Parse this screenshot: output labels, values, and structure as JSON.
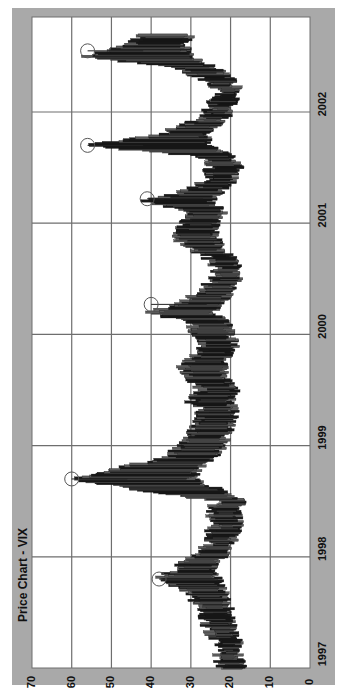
{
  "chart_data": {
    "type": "bar",
    "subtype": "high-low price bars (weekly), rotated 90 degrees",
    "title": "Price Chart - VIX",
    "xlabel": "",
    "ylabel": "",
    "value_axis": {
      "ticks": [
        70,
        60,
        50,
        40,
        30,
        20,
        10,
        0
      ],
      "range": [
        0,
        70
      ],
      "grid": true
    },
    "time_axis": {
      "ticks": [
        "1997",
        "1998",
        "1999",
        "2000",
        "2001",
        "2002"
      ],
      "grid": true
    },
    "orientation": "value axis horizontal (70 left to 0 right); time axis vertical (1997 bottom to 2002 top)",
    "series": [
      {
        "name": "VIX weekly range",
        "points": [
          {
            "t": 1997.0,
            "low": 17,
            "high": 22
          },
          {
            "t": 1997.1,
            "low": 18,
            "high": 23
          },
          {
            "t": 1997.2,
            "low": 18,
            "high": 22
          },
          {
            "t": 1997.3,
            "low": 19,
            "high": 25
          },
          {
            "t": 1997.4,
            "low": 20,
            "high": 27
          },
          {
            "t": 1997.5,
            "low": 20,
            "high": 26
          },
          {
            "t": 1997.6,
            "low": 21,
            "high": 29
          },
          {
            "t": 1997.7,
            "low": 22,
            "high": 31
          },
          {
            "t": 1997.8,
            "low": 23,
            "high": 38
          },
          {
            "t": 1997.9,
            "low": 25,
            "high": 33
          },
          {
            "t": 1998.0,
            "low": 22,
            "high": 30
          },
          {
            "t": 1998.1,
            "low": 20,
            "high": 26
          },
          {
            "t": 1998.2,
            "low": 19,
            "high": 25
          },
          {
            "t": 1998.3,
            "low": 18,
            "high": 24
          },
          {
            "t": 1998.4,
            "low": 18,
            "high": 25
          },
          {
            "t": 1998.5,
            "low": 17,
            "high": 23
          },
          {
            "t": 1998.6,
            "low": 22,
            "high": 42
          },
          {
            "t": 1998.7,
            "low": 30,
            "high": 60
          },
          {
            "t": 1998.8,
            "low": 28,
            "high": 48
          },
          {
            "t": 1998.9,
            "low": 24,
            "high": 35
          },
          {
            "t": 1999.0,
            "low": 22,
            "high": 33
          },
          {
            "t": 1999.1,
            "low": 21,
            "high": 30
          },
          {
            "t": 1999.2,
            "low": 20,
            "high": 28
          },
          {
            "t": 1999.3,
            "low": 19,
            "high": 27
          },
          {
            "t": 1999.4,
            "low": 20,
            "high": 30
          },
          {
            "t": 1999.5,
            "low": 19,
            "high": 27
          },
          {
            "t": 1999.6,
            "low": 21,
            "high": 30
          },
          {
            "t": 1999.7,
            "low": 22,
            "high": 32
          },
          {
            "t": 1999.8,
            "low": 21,
            "high": 29
          },
          {
            "t": 1999.9,
            "low": 19,
            "high": 26
          },
          {
            "t": 2000.0,
            "low": 20,
            "high": 29
          },
          {
            "t": 2000.1,
            "low": 21,
            "high": 30
          },
          {
            "t": 2000.2,
            "low": 24,
            "high": 40
          },
          {
            "t": 2000.3,
            "low": 22,
            "high": 31
          },
          {
            "t": 2000.4,
            "low": 20,
            "high": 27
          },
          {
            "t": 2000.5,
            "low": 18,
            "high": 24
          },
          {
            "t": 2000.6,
            "low": 18,
            "high": 23
          },
          {
            "t": 2000.7,
            "low": 20,
            "high": 26
          },
          {
            "t": 2000.8,
            "low": 23,
            "high": 32
          },
          {
            "t": 2000.9,
            "low": 24,
            "high": 33
          },
          {
            "t": 2001.0,
            "low": 24,
            "high": 32
          },
          {
            "t": 2001.1,
            "low": 22,
            "high": 30
          },
          {
            "t": 2001.2,
            "low": 25,
            "high": 41
          },
          {
            "t": 2001.3,
            "low": 22,
            "high": 30
          },
          {
            "t": 2001.4,
            "low": 19,
            "high": 26
          },
          {
            "t": 2001.5,
            "low": 18,
            "high": 25
          },
          {
            "t": 2001.6,
            "low": 20,
            "high": 27
          },
          {
            "t": 2001.7,
            "low": 25,
            "high": 56
          },
          {
            "t": 2001.8,
            "low": 27,
            "high": 38
          },
          {
            "t": 2001.9,
            "low": 23,
            "high": 30
          },
          {
            "t": 2002.0,
            "low": 20,
            "high": 26
          },
          {
            "t": 2002.1,
            "low": 19,
            "high": 24
          },
          {
            "t": 2002.2,
            "low": 18,
            "high": 22
          },
          {
            "t": 2002.3,
            "low": 20,
            "high": 27
          },
          {
            "t": 2002.4,
            "low": 24,
            "high": 33
          },
          {
            "t": 2002.5,
            "low": 30,
            "high": 56
          },
          {
            "t": 2002.6,
            "low": 32,
            "high": 45
          },
          {
            "t": 2002.7,
            "low": 30,
            "high": 42
          }
        ]
      }
    ],
    "annotations": [
      {
        "type": "circle",
        "t": 1997.8,
        "value": 38
      },
      {
        "type": "circle",
        "t": 1998.7,
        "value": 60
      },
      {
        "type": "circle",
        "t": 2000.27,
        "value": 40
      },
      {
        "type": "circle",
        "t": 2001.22,
        "value": 41
      },
      {
        "type": "circle",
        "t": 2001.7,
        "value": 56
      },
      {
        "type": "circle",
        "t": 2002.55,
        "value": 56
      }
    ],
    "legend": null
  },
  "colors": {
    "panel": "#a9a9a9",
    "plot_bg": "#ffffff",
    "grid": "#6e6e6e",
    "bars": "#1a1a1a",
    "circle": "#555555",
    "text": "#111111"
  },
  "layout": {
    "plot": {
      "left": 32,
      "top": 17,
      "right": 310,
      "bottom": 668
    },
    "time_min": 1997.0,
    "time_max": 2002.75,
    "value_max": 70
  }
}
